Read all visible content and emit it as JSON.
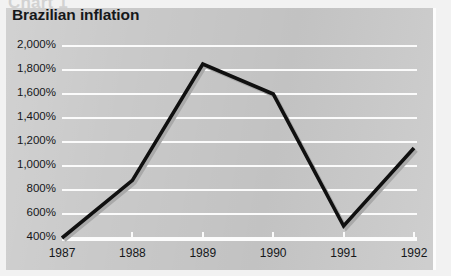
{
  "page": {
    "cut_headline": "Chart 1",
    "background_color": "#c9c9c9",
    "gridline_color": "#fbfbfb",
    "line_color": "#101010",
    "shadow_color": "#a9a9a9"
  },
  "chart_data": {
    "type": "line",
    "title": "Brazilian inflation",
    "xlabel": "",
    "ylabel": "",
    "categories": [
      "1987",
      "1988",
      "1989",
      "1990",
      "1991",
      "1992"
    ],
    "x": [
      1987,
      1988,
      1989,
      1990,
      1991,
      1992
    ],
    "values": [
      400,
      880,
      1850,
      1600,
      500,
      1150
    ],
    "series": [
      {
        "name": "Brazilian inflation",
        "values": [
          400,
          880,
          1850,
          1600,
          500,
          1150
        ]
      }
    ],
    "ylim": [
      400,
      2000
    ],
    "ytick_values": [
      2000,
      1800,
      1600,
      1400,
      1200,
      1000,
      800,
      600,
      400
    ],
    "ytick_labels": [
      "2,000%",
      "1,800%",
      "1,600%",
      "1,400%",
      "1,200%",
      "1,000%",
      "800%",
      "600%",
      "400%"
    ],
    "xtick_labels": [
      "1987",
      "1988",
      "1989",
      "1990",
      "1991",
      "1992"
    ],
    "grid": true,
    "legend": "none",
    "units": "%"
  }
}
